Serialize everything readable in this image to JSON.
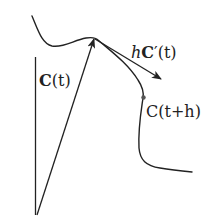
{
  "figure": {
    "colors": {
      "background": "#ffffff",
      "ink": "#222222",
      "point": "#555555"
    },
    "labels": {
      "position_vector": {
        "bold": "C",
        "rest": "(t)"
      },
      "tangent_vector": {
        "italic": "h",
        "bold": "C",
        "rest": "′(t)"
      },
      "nearby_point": {
        "bold": "C",
        "rest": "(t+h)"
      }
    },
    "elements": [
      "curve C",
      "vertical reference line",
      "position vector C(t) arrow from origin to curve",
      "tangent vector hC'(t) arrow",
      "point C(t+h) on curve"
    ]
  }
}
